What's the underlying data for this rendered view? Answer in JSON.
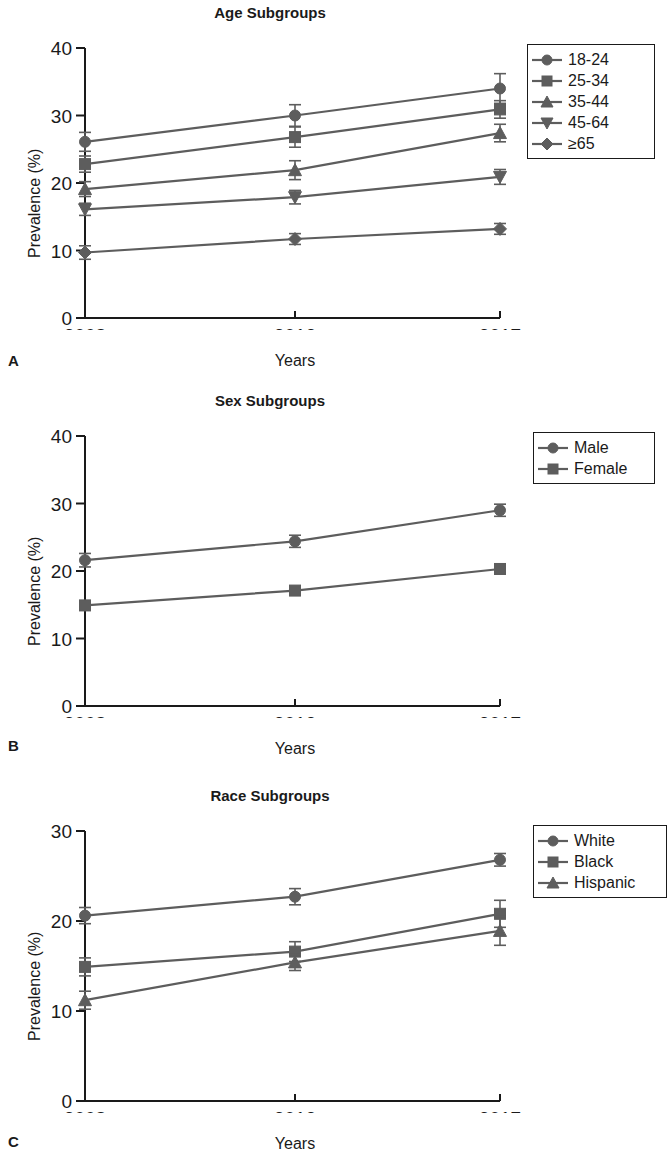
{
  "figure": {
    "axis_color": "#1a1a1a",
    "series_color": "#5d5d5d",
    "background": "#ffffff"
  },
  "panels": [
    {
      "letter": "A",
      "title": "Age Subgroups",
      "xlabel": "Years",
      "ylabel": "Prevalence (%)",
      "legend": [
        {
          "label": "18-24",
          "marker": "circle"
        },
        {
          "label": "25-34",
          "marker": "square"
        },
        {
          "label": "35-44",
          "marker": "triangle-up"
        },
        {
          "label": "45-64",
          "marker": "triangle-down"
        },
        {
          "label": "≥65",
          "marker": "diamond"
        }
      ]
    },
    {
      "letter": "B",
      "title": "Sex Subgroups",
      "xlabel": "Years",
      "ylabel": "Prevalence (%)",
      "legend": [
        {
          "label": "Male",
          "marker": "circle"
        },
        {
          "label": "Female",
          "marker": "square"
        }
      ]
    },
    {
      "letter": "C",
      "title": "Race Subgroups",
      "xlabel": "Years",
      "ylabel": "Prevalence (%)",
      "legend": [
        {
          "label": "White",
          "marker": "circle"
        },
        {
          "label": "Black",
          "marker": "square"
        },
        {
          "label": "Hispanic",
          "marker": "triangle-up"
        }
      ]
    }
  ],
  "chart_data": [
    {
      "type": "line",
      "panel": "A",
      "title": "Age Subgroups",
      "xlabel": "Years",
      "ylabel": "Prevalence (%)",
      "x": [
        "2008",
        "2012",
        "2017"
      ],
      "xtick_labels": [
        "2008",
        "2012",
        "2017"
      ],
      "ytick_labels": [
        "0",
        "10",
        "20",
        "30",
        "40"
      ],
      "yticks": [
        0,
        10,
        20,
        30,
        40
      ],
      "ylim": [
        0,
        40
      ],
      "grid": false,
      "legend_position": "right",
      "errorbars": true,
      "series": [
        {
          "name": "18-24",
          "marker": "circle",
          "values": [
            26.1,
            30.0,
            34.0
          ],
          "err": [
            1.4,
            1.6,
            2.2
          ]
        },
        {
          "name": "25-34",
          "marker": "square",
          "values": [
            22.8,
            26.8,
            30.9
          ],
          "err": [
            1.2,
            1.5,
            1.3
          ]
        },
        {
          "name": "35-44",
          "marker": "triangle-up",
          "values": [
            19.1,
            21.9,
            27.4
          ],
          "err": [
            1.1,
            1.4,
            1.3
          ]
        },
        {
          "name": "45-64",
          "marker": "triangle-down",
          "values": [
            16.1,
            17.9,
            20.9
          ],
          "err": [
            0.9,
            1.0,
            1.1
          ]
        },
        {
          "name": "≥65",
          "marker": "diamond",
          "values": [
            9.7,
            11.7,
            13.2
          ],
          "err": [
            1.0,
            0.8,
            0.8
          ]
        }
      ]
    },
    {
      "type": "line",
      "panel": "B",
      "title": "Sex Subgroups",
      "xlabel": "Years",
      "ylabel": "Prevalence (%)",
      "x": [
        "2008",
        "2012",
        "2017"
      ],
      "xtick_labels": [
        "2008",
        "2012",
        "2017"
      ],
      "ytick_labels": [
        "0",
        "10",
        "20",
        "30",
        "40"
      ],
      "yticks": [
        0,
        10,
        20,
        30,
        40
      ],
      "ylim": [
        0,
        40
      ],
      "grid": false,
      "legend_position": "right",
      "errorbars": true,
      "series": [
        {
          "name": "Male",
          "marker": "circle",
          "values": [
            21.6,
            24.4,
            29.0
          ],
          "err": [
            1.0,
            0.9,
            0.9
          ]
        },
        {
          "name": "Female",
          "marker": "square",
          "values": [
            14.9,
            17.1,
            20.3
          ],
          "err": [
            0.7,
            0.6,
            0.7
          ]
        }
      ]
    },
    {
      "type": "line",
      "panel": "C",
      "title": "Race Subgroups",
      "xlabel": "Years",
      "ylabel": "Prevalence (%)",
      "x": [
        "2008",
        "2012",
        "2017"
      ],
      "xtick_labels": [
        "2008",
        "2012",
        "2017"
      ],
      "ytick_labels": [
        "0",
        "10",
        "20",
        "30"
      ],
      "yticks": [
        0,
        10,
        20,
        30
      ],
      "ylim": [
        0,
        30
      ],
      "grid": false,
      "legend_position": "right",
      "errorbars": true,
      "series": [
        {
          "name": "White",
          "marker": "circle",
          "values": [
            20.6,
            22.7,
            26.8
          ],
          "err": [
            0.9,
            0.9,
            0.7
          ]
        },
        {
          "name": "Black",
          "marker": "square",
          "values": [
            14.9,
            16.6,
            20.8
          ],
          "err": [
            1.0,
            1.1,
            1.5
          ]
        },
        {
          "name": "Hispanic",
          "marker": "triangle-up",
          "values": [
            11.2,
            15.4,
            18.9
          ],
          "err": [
            1.0,
            0.9,
            1.6
          ]
        }
      ]
    }
  ]
}
